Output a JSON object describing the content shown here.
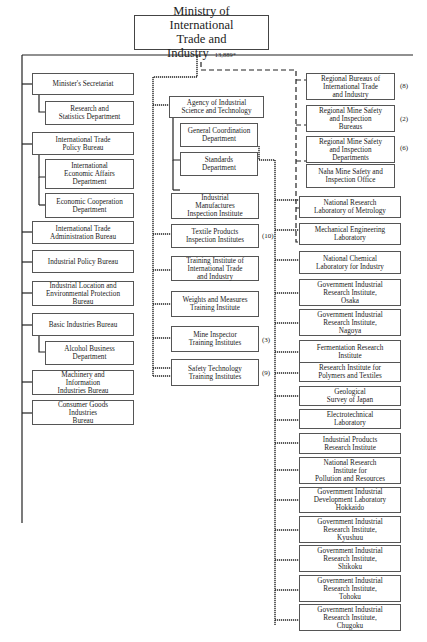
{
  "ministry": {
    "line1": "Ministry of International",
    "line2": "Trade and Industry",
    "count": "13,889*"
  },
  "internal_bureaus": [
    {
      "label": "Minister's Secretariat"
    },
    {
      "label": "Research and\nStatistics Department"
    },
    {
      "label": "International Trade\nPolicy Bureau"
    },
    {
      "label": "International\nEconomic Affairs\nDepartment"
    },
    {
      "label": "Economic Cooperation\nDepartment"
    },
    {
      "label": "International Trade\nAdministration Bureau"
    },
    {
      "label": "Industrial Policy Bureau"
    },
    {
      "label": "Industrial Location and\nEnvironmental Protection\nBureau"
    },
    {
      "label": "Basic Industries Bureau"
    },
    {
      "label": "Alcohol Business\nDepartment"
    },
    {
      "label": "Machinery and\nInformation\nIndustries Bureau"
    },
    {
      "label": "Consumer Goods\nIndustries\nBureau"
    }
  ],
  "agency": {
    "label": "Agency of Industrial\nScience and Technology",
    "departments": [
      {
        "label": "General Coordination\nDepartment"
      },
      {
        "label": "Standards\nDepartment"
      }
    ]
  },
  "attached_institutions": [
    {
      "label": "Industrial\nManufactures\nInspection Institute",
      "count": ""
    },
    {
      "label": "Textile Products\nInspection Institutes",
      "count": "(10)"
    },
    {
      "label": "Training Institute of\nInternational Trade\nand Industry",
      "count": ""
    },
    {
      "label": "Weights and Measures\nTraining Institute",
      "count": ""
    },
    {
      "label": "Mine Inspector\nTraining Institutes",
      "count": "(3)"
    },
    {
      "label": "Safety Technology\nTraining Institutes",
      "count": "(9)"
    }
  ],
  "local_branches": [
    {
      "label": "Regional Bureaus of\nInternational Trade\nand Industry",
      "count": "(8)"
    },
    {
      "label": "Regional Mine Safety\nand Inspection\nBureaus",
      "count": "(2)"
    },
    {
      "label": "Regional Mine Safety\nand Inspection\nDepartments",
      "count": "(6)"
    },
    {
      "label": "Naha Mine Safety and\nInspection Office",
      "count": ""
    }
  ],
  "research_institutes": [
    {
      "label": "National Research\nLaboratory of Metrology"
    },
    {
      "label": "Mechanical Engineering\nLaboratory"
    },
    {
      "label": "National Chemical\nLaboratory for Industry"
    },
    {
      "label": "Government Industrial\nResearch Institute,\nOsaka"
    },
    {
      "label": "Government Industrial\nResearch Institute,\nNagoya"
    },
    {
      "label": "Fermentation Research\nInstitute"
    },
    {
      "label": "Research Institute for\nPolymers and Textiles"
    },
    {
      "label": "Geological\nSurvey of Japan"
    },
    {
      "label": "Electrotechnical\nLaboratory"
    },
    {
      "label": "Industrial Products\nResearch Institute"
    },
    {
      "label": "National Research\nInstitute for\nPollution and Resources"
    },
    {
      "label": "Government Industrial\nDevelopment Laboratory\nHokkaido"
    },
    {
      "label": "Government Industrial\nResearch Institute,\nKyushuu"
    },
    {
      "label": "Government Industrial\nResearch Institute,\nShikoku"
    },
    {
      "label": "Government Industrial\nResearch Institute,\nTohoku"
    },
    {
      "label": "Government Industrial\nResearch Institute,\nChugoku"
    }
  ]
}
